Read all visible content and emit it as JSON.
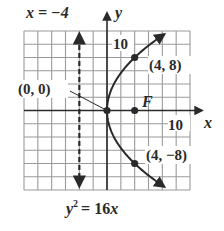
{
  "chart_data": {
    "type": "line",
    "title": "",
    "equation_label": "y² = 16x",
    "equation": {
      "lhs_base": "y",
      "lhs_exp": "2",
      "rhs": "= 16",
      "rhs_var": "x"
    },
    "xlabel": "x",
    "ylabel": "y",
    "xlim": [
      -12,
      12
    ],
    "ylim": [
      -12,
      12
    ],
    "grid": true,
    "grid_step": 2,
    "x_tick_labels": [
      {
        "value": 10,
        "label": "10"
      }
    ],
    "y_tick_labels": [
      {
        "value": 10,
        "label": "10"
      }
    ],
    "series": [
      {
        "name": "parabola y^2 = 16x",
        "kind": "curve",
        "param": "x = y^2/16",
        "y_range": [
          -11.5,
          11.5
        ],
        "arrows": "both-ends"
      }
    ],
    "directrix": {
      "label": "x = −4",
      "x": -4,
      "style": "dashed",
      "arrows": "both-ends"
    },
    "points": [
      {
        "name": "vertex",
        "x": 0,
        "y": 0,
        "label": "(0, 0)"
      },
      {
        "name": "point-upper",
        "x": 4,
        "y": 8,
        "label": "(4, 8)"
      },
      {
        "name": "point-lower",
        "x": 4,
        "y": -8,
        "label": "(4, −8)"
      },
      {
        "name": "focus",
        "x": 4,
        "y": 0,
        "label": "F"
      }
    ],
    "colors": {
      "ink": "#2a2a2a",
      "grid": "#9a9a9a",
      "background": "#ffffff"
    }
  }
}
